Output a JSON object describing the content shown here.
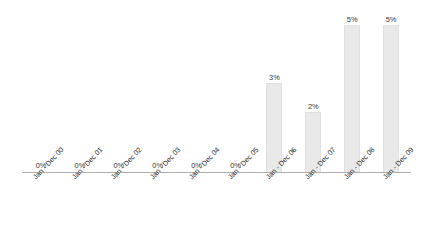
{
  "chart_data": {
    "type": "bar",
    "title": "",
    "subtitle": "",
    "xlabel": "",
    "ylabel": "Total Meat Sales in Total Income (%)",
    "categories": [
      "Jan - Dec 00",
      "Jan - Dec 01",
      "Jan - Dec 02",
      "Jan - Dec 03",
      "Jan - Dec 04",
      "Jan - Dec 05",
      "Jan - Dec 06",
      "Jan - Dec 07",
      "Jan - Dec 08",
      "Jan - Dec 09"
    ],
    "values": [
      0,
      0,
      0,
      0,
      0,
      0,
      3,
      2,
      5,
      5
    ],
    "data_labels": [
      "0%",
      "0%",
      "0%",
      "0%",
      "0%",
      "0%",
      "3%",
      "2%",
      "5%",
      "5%"
    ],
    "ylim": [
      0,
      5.6
    ],
    "grid": false,
    "legend": false,
    "legend_position": "none",
    "bar_color": "#e9e9e9",
    "axis_color": "#adadad",
    "text_color": "#2f2f2f"
  }
}
